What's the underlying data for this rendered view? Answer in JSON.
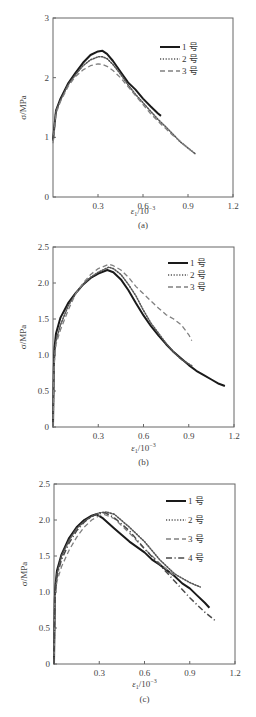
{
  "chart_data": [
    {
      "type": "line",
      "panel_label": "(a)",
      "xlabel": "ε1/10^-3",
      "xlabel_main": "ε",
      "xlabel_sub": "1",
      "xlabel_unit": "/10",
      "xlabel_sup": "−3",
      "ylabel": "σ/MPa",
      "xlim": [
        0,
        1.2
      ],
      "ylim": [
        0,
        3
      ],
      "xticks": [
        0.3,
        0.6,
        0.9,
        1.2
      ],
      "xtick_labels": [
        "0.3",
        "0.6",
        "0.9",
        "1.2"
      ],
      "yticks": [
        0,
        1,
        2,
        3
      ],
      "ytick_labels": [
        "0",
        "1",
        "2",
        "3"
      ],
      "grid": false,
      "legend_position": "upper right",
      "series": [
        {
          "name": "1 号",
          "style": "solid",
          "x": [
            0,
            0.02,
            0.05,
            0.1,
            0.15,
            0.2,
            0.25,
            0.3,
            0.33,
            0.36,
            0.4,
            0.45,
            0.5,
            0.55,
            0.6,
            0.65,
            0.7,
            0.72
          ],
          "y": [
            0.95,
            1.45,
            1.65,
            1.9,
            2.08,
            2.25,
            2.38,
            2.44,
            2.45,
            2.4,
            2.28,
            2.1,
            1.92,
            1.8,
            1.65,
            1.52,
            1.4,
            1.36
          ]
        },
        {
          "name": "2 号",
          "style": "dotted",
          "x": [
            0,
            0.02,
            0.05,
            0.1,
            0.15,
            0.2,
            0.25,
            0.3,
            0.33,
            0.36,
            0.4,
            0.45,
            0.5,
            0.55,
            0.6,
            0.65,
            0.7,
            0.75,
            0.8,
            0.85,
            0.9,
            0.95
          ],
          "y": [
            0.95,
            1.45,
            1.62,
            1.88,
            2.05,
            2.2,
            2.3,
            2.35,
            2.35,
            2.32,
            2.22,
            2.06,
            1.88,
            1.72,
            1.58,
            1.44,
            1.3,
            1.18,
            1.05,
            0.92,
            0.82,
            0.72
          ]
        },
        {
          "name": "3 号",
          "style": "dashed",
          "x": [
            0,
            0.02,
            0.05,
            0.1,
            0.15,
            0.2,
            0.25,
            0.3,
            0.33,
            0.36,
            0.4,
            0.45,
            0.5,
            0.55,
            0.6,
            0.65,
            0.7,
            0.75,
            0.8,
            0.85,
            0.9,
            0.95
          ],
          "y": [
            0.9,
            1.4,
            1.6,
            1.85,
            2.02,
            2.13,
            2.2,
            2.23,
            2.22,
            2.19,
            2.12,
            2.0,
            1.85,
            1.7,
            1.55,
            1.4,
            1.27,
            1.15,
            1.03,
            0.93,
            0.82,
            0.72
          ]
        }
      ]
    },
    {
      "type": "line",
      "panel_label": "(b)",
      "xlabel": "ε1/10^-3",
      "xlabel_main": "ε",
      "xlabel_sub": "1",
      "xlabel_unit": "/10",
      "xlabel_sup": "−3",
      "ylabel": "σ/MPa",
      "xlim": [
        0,
        1.2
      ],
      "ylim": [
        0,
        2.5
      ],
      "xticks": [
        0.3,
        0.6,
        0.9,
        1.2
      ],
      "xtick_labels": [
        "0.3",
        "0.6",
        "0.9",
        "1.2"
      ],
      "yticks": [
        0,
        0.5,
        1.0,
        1.5,
        2.0,
        2.5
      ],
      "ytick_labels": [
        "0",
        "0.5",
        "1.0",
        "1.5",
        "2.0",
        "2.5"
      ],
      "grid": false,
      "legend_position": "upper right",
      "series": [
        {
          "name": "1 号",
          "style": "solid",
          "x": [
            0,
            0.005,
            0.01,
            0.02,
            0.05,
            0.1,
            0.15,
            0.2,
            0.25,
            0.3,
            0.36,
            0.4,
            0.45,
            0.5,
            0.55,
            0.6,
            0.65,
            0.7,
            0.75,
            0.8,
            0.85,
            0.9,
            0.95,
            1.0,
            1.05,
            1.1,
            1.14
          ],
          "y": [
            0,
            0.8,
            1.1,
            1.3,
            1.52,
            1.72,
            1.86,
            1.98,
            2.07,
            2.13,
            2.18,
            2.15,
            2.05,
            1.9,
            1.72,
            1.55,
            1.4,
            1.27,
            1.15,
            1.04,
            0.95,
            0.86,
            0.78,
            0.72,
            0.66,
            0.6,
            0.57
          ]
        },
        {
          "name": "2 号",
          "style": "dotted",
          "x": [
            0,
            0.005,
            0.01,
            0.02,
            0.05,
            0.1,
            0.15,
            0.2,
            0.25,
            0.3,
            0.37,
            0.4,
            0.45,
            0.5,
            0.55,
            0.6,
            0.65,
            0.7,
            0.75,
            0.8,
            0.85,
            0.92
          ],
          "y": [
            0,
            0.75,
            1.0,
            1.2,
            1.42,
            1.68,
            1.85,
            1.98,
            2.08,
            2.15,
            2.22,
            2.2,
            2.12,
            1.98,
            1.82,
            1.62,
            1.44,
            1.3,
            1.16,
            1.04,
            0.94,
            0.85
          ]
        },
        {
          "name": "3 号",
          "style": "dashed",
          "x": [
            0,
            0.005,
            0.01,
            0.02,
            0.05,
            0.1,
            0.15,
            0.2,
            0.25,
            0.3,
            0.37,
            0.4,
            0.45,
            0.5,
            0.55,
            0.6,
            0.65,
            0.7,
            0.75,
            0.8,
            0.85,
            0.9,
            0.92
          ],
          "y": [
            0,
            0.7,
            0.95,
            1.15,
            1.35,
            1.62,
            1.85,
            2.0,
            2.12,
            2.2,
            2.26,
            2.24,
            2.18,
            2.08,
            1.95,
            1.85,
            1.75,
            1.65,
            1.56,
            1.5,
            1.42,
            1.28,
            1.2
          ]
        }
      ]
    },
    {
      "type": "line",
      "panel_label": "(c)",
      "xlabel": "ε1/10^-3",
      "xlabel_main": "ε",
      "xlabel_sub": "1",
      "xlabel_unit": "/10",
      "xlabel_sup": "−3",
      "ylabel": "σ/MPa",
      "xlim": [
        0,
        1.2
      ],
      "ylim": [
        0,
        2.5
      ],
      "xticks": [
        0.3,
        0.6,
        0.9,
        1.2
      ],
      "xtick_labels": [
        "0.3",
        "0.6",
        "0.9",
        "1.2"
      ],
      "yticks": [
        0,
        0.5,
        1.0,
        1.5,
        2.0,
        2.5
      ],
      "ytick_labels": [
        "0",
        "0.5",
        "1.0",
        "1.5",
        "2.0",
        "2.5"
      ],
      "grid": false,
      "legend_position": "upper right",
      "series": [
        {
          "name": "1 号",
          "style": "solid",
          "x": [
            0,
            0.005,
            0.01,
            0.02,
            0.05,
            0.1,
            0.15,
            0.2,
            0.25,
            0.28,
            0.32,
            0.4,
            0.5,
            0.6,
            0.65,
            0.7,
            0.8,
            0.85,
            0.9,
            0.95,
            1.0,
            1.03
          ],
          "y": [
            0,
            0.9,
            1.1,
            1.3,
            1.52,
            1.75,
            1.9,
            2.0,
            2.06,
            2.08,
            2.03,
            1.88,
            1.7,
            1.55,
            1.45,
            1.38,
            1.22,
            1.12,
            1.05,
            0.95,
            0.85,
            0.78
          ]
        },
        {
          "name": "2 号",
          "style": "dotted",
          "x": [
            0,
            0.005,
            0.01,
            0.02,
            0.05,
            0.1,
            0.15,
            0.2,
            0.25,
            0.3,
            0.35,
            0.4,
            0.5,
            0.6,
            0.7,
            0.8,
            0.9,
            0.97
          ],
          "y": [
            0,
            0.9,
            1.05,
            1.25,
            1.5,
            1.72,
            1.88,
            1.98,
            2.05,
            2.1,
            2.11,
            2.08,
            1.9,
            1.7,
            1.45,
            1.25,
            1.13,
            1.07
          ]
        },
        {
          "name": "3 号",
          "style": "dashed",
          "x": [
            0,
            0.005,
            0.01,
            0.02,
            0.05,
            0.1,
            0.15,
            0.2,
            0.25,
            0.3,
            0.33,
            0.4,
            0.5,
            0.6,
            0.7,
            0.8
          ],
          "y": [
            0,
            0.8,
            1.0,
            1.15,
            1.35,
            1.58,
            1.76,
            1.9,
            2.0,
            2.06,
            2.08,
            2.02,
            1.82,
            1.6,
            1.4,
            1.22
          ]
        },
        {
          "name": "4 号",
          "style": "dashdot",
          "x": [
            0,
            0.005,
            0.01,
            0.02,
            0.05,
            0.1,
            0.15,
            0.2,
            0.25,
            0.3,
            0.34,
            0.4,
            0.5,
            0.6,
            0.7,
            0.8,
            0.9,
            1.0,
            1.07
          ],
          "y": [
            0,
            0.85,
            1.05,
            1.22,
            1.45,
            1.68,
            1.85,
            1.97,
            2.05,
            2.09,
            2.1,
            2.03,
            1.85,
            1.6,
            1.38,
            1.15,
            0.92,
            0.72,
            0.6
          ]
        }
      ]
    }
  ],
  "colors": {
    "series_1": "#1a1a1a",
    "series_2": "#555555",
    "series_3": "#808080",
    "series_4": "#4a4a4a",
    "axis": "#666666"
  }
}
